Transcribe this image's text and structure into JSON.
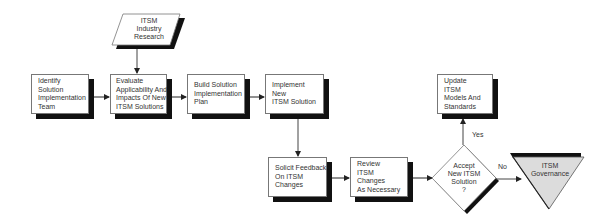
{
  "diagram": {
    "type": "flowchart",
    "nodes": [
      {
        "id": "research",
        "shape": "parallelogram",
        "lines": [
          "ITSM",
          "Industry",
          "Research"
        ]
      },
      {
        "id": "identify",
        "shape": "rectangle",
        "lines": [
          "Identify",
          "Solution",
          "Implementation",
          "Team"
        ]
      },
      {
        "id": "evaluate",
        "shape": "rectangle",
        "lines": [
          "Evaluate",
          "Applicability  And",
          "Impacts Of  New",
          "ITSM Solutions"
        ]
      },
      {
        "id": "build",
        "shape": "rectangle",
        "lines": [
          "Build Solution",
          "Implementation",
          "Plan"
        ]
      },
      {
        "id": "implement",
        "shape": "rectangle",
        "lines": [
          "Implement",
          "New",
          "ITSM Solution"
        ]
      },
      {
        "id": "solicit",
        "shape": "rectangle",
        "lines": [
          "Solicit Feedback",
          "On ITSM",
          "Changes"
        ]
      },
      {
        "id": "review",
        "shape": "rectangle",
        "lines": [
          "Review",
          "ITSM",
          "Changes",
          "As Necessary"
        ]
      },
      {
        "id": "accept",
        "shape": "diamond",
        "lines": [
          "Accept",
          "New ITSM",
          "Solution",
          "?"
        ]
      },
      {
        "id": "update",
        "shape": "rectangle",
        "lines": [
          "Update",
          "ITSM",
          "Models And",
          "Standards"
        ]
      },
      {
        "id": "governance",
        "shape": "inverted-triangle",
        "lines": [
          "ITSM",
          "Governance"
        ]
      }
    ],
    "edges": [
      {
        "from": "research",
        "to": "evaluate",
        "label": ""
      },
      {
        "from": "identify",
        "to": "evaluate",
        "label": ""
      },
      {
        "from": "evaluate",
        "to": "build",
        "label": ""
      },
      {
        "from": "build",
        "to": "implement",
        "label": ""
      },
      {
        "from": "implement",
        "to": "solicit",
        "label": ""
      },
      {
        "from": "solicit",
        "to": "review",
        "label": ""
      },
      {
        "from": "review",
        "to": "accept",
        "label": ""
      },
      {
        "from": "accept",
        "to": "update",
        "label": "Yes"
      },
      {
        "from": "accept",
        "to": "governance",
        "label": "No"
      }
    ],
    "edge_labels": {
      "yes": "Yes",
      "no": "No"
    },
    "colors": {
      "shadow": "#111111",
      "border": "#777777",
      "terminal_fill": "#dcdcdc"
    }
  }
}
